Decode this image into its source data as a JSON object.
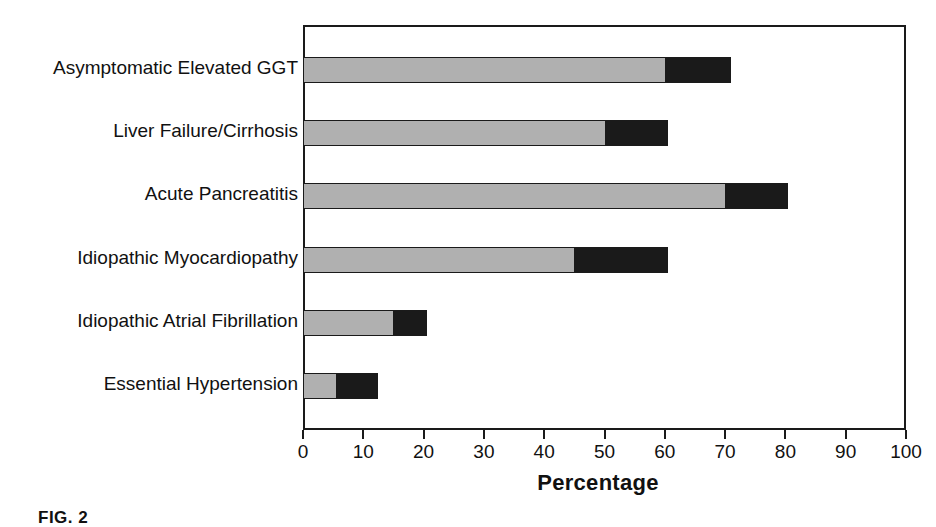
{
  "chart_data": {
    "type": "bar",
    "orientation": "horizontal",
    "stacked": true,
    "title": "",
    "xlabel": "Percentage",
    "ylabel": "",
    "xlim": [
      0,
      100
    ],
    "xticks": [
      0,
      10,
      20,
      30,
      40,
      50,
      60,
      70,
      80,
      90,
      100
    ],
    "xtick_labels": [
      "0",
      "10",
      "20",
      "30",
      "40",
      "50",
      "60",
      "70",
      "80",
      "90",
      "100"
    ],
    "grid": false,
    "legend": "none",
    "categories": [
      "Asymptomatic Elevated GGT",
      "Liver Failure/Cirrhosis",
      "Acute Pancreatitis",
      "Idiopathic Myocardiopathy",
      "Idiopathic Atrial Fibrillation",
      "Essential Hypertension"
    ],
    "series": [
      {
        "name": "segment-gray",
        "color": "#b0b0b0",
        "values": [
          60,
          50,
          70,
          45,
          15,
          5.5
        ]
      },
      {
        "name": "segment-black",
        "color": "#1a1a1a",
        "values": [
          11,
          10.5,
          10.5,
          15.5,
          5.5,
          7
        ]
      }
    ],
    "totals": [
      71,
      60.5,
      80.5,
      60.5,
      20.5,
      12.5
    ],
    "colors": {
      "gray_segment": "#b0b0b0",
      "black_segment": "#1a1a1a",
      "axis": "#1a1a1a",
      "background": "#ffffff"
    }
  },
  "caption": {
    "text": "FIG. 2"
  }
}
